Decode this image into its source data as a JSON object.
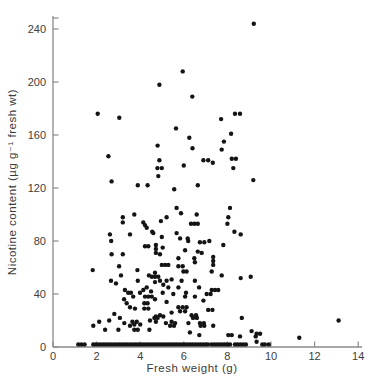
{
  "figure": {
    "background": "#ffffff",
    "axis_color": "#8a8a8a",
    "dot_color": "#141414",
    "text_color": "#3d3d3d"
  },
  "chart_data": {
    "type": "scatter",
    "title": "",
    "xlabel": "Fresh weight (g)",
    "ylabel": "Nicotine content (µg g⁻¹ fresh wt)",
    "xlim": [
      0,
      14.3
    ],
    "ylim": [
      0,
      252
    ],
    "x_ticks": [
      0,
      2,
      4,
      6,
      8,
      10,
      12,
      14
    ],
    "y_ticks": [
      0,
      40,
      80,
      120,
      160,
      200,
      240
    ],
    "grid": false,
    "legend": "none",
    "marker": {
      "shape": "circle",
      "color": "#141414",
      "radius_px": 2.2
    },
    "points": [
      [
        9.21,
        244
      ],
      [
        5.95,
        208
      ],
      [
        4.88,
        198
      ],
      [
        6.39,
        189
      ],
      [
        2.05,
        176
      ],
      [
        8.35,
        176
      ],
      [
        8.58,
        176
      ],
      [
        3.04,
        173
      ],
      [
        7.71,
        172
      ],
      [
        5.64,
        165
      ],
      [
        8.17,
        161
      ],
      [
        6.25,
        158
      ],
      [
        7.84,
        155
      ],
      [
        4.8,
        152
      ],
      [
        6.4,
        150
      ],
      [
        7.74,
        149
      ],
      [
        2.54,
        144
      ],
      [
        8.2,
        142
      ],
      [
        8.39,
        142
      ],
      [
        4.88,
        141
      ],
      [
        6.9,
        141
      ],
      [
        7.12,
        141
      ],
      [
        7.33,
        139
      ],
      [
        6.0,
        137
      ],
      [
        4.79,
        135
      ],
      [
        4.99,
        135
      ],
      [
        8.27,
        135
      ],
      [
        4.83,
        129
      ],
      [
        9.19,
        126
      ],
      [
        2.69,
        125
      ],
      [
        3.89,
        122
      ],
      [
        4.34,
        122
      ],
      [
        6.64,
        122
      ],
      [
        5.56,
        119
      ],
      [
        5.67,
        105
      ],
      [
        8.12,
        105
      ],
      [
        5.87,
        101
      ],
      [
        6.59,
        100
      ],
      [
        3.73,
        100
      ],
      [
        3.2,
        98
      ],
      [
        5.21,
        98
      ],
      [
        8.04,
        98
      ],
      [
        4.95,
        95
      ],
      [
        3.2,
        94
      ],
      [
        4.14,
        94
      ],
      [
        6.33,
        93
      ],
      [
        6.48,
        93
      ],
      [
        6.64,
        93
      ],
      [
        8.0,
        93
      ],
      [
        4.22,
        92
      ],
      [
        4.3,
        90
      ],
      [
        4.55,
        87
      ],
      [
        8.32,
        87
      ],
      [
        5.67,
        86
      ],
      [
        4.6,
        86
      ],
      [
        2.61,
        85
      ],
      [
        3.53,
        85
      ],
      [
        4.99,
        83
      ],
      [
        5.83,
        82
      ],
      [
        8.61,
        85
      ],
      [
        6.18,
        82
      ],
      [
        2.67,
        80
      ],
      [
        6.2,
        80
      ],
      [
        6.74,
        79
      ],
      [
        6.94,
        79
      ],
      [
        7.17,
        80
      ],
      [
        7.81,
        77
      ],
      [
        4.72,
        77
      ],
      [
        4.22,
        76
      ],
      [
        4.37,
        76
      ],
      [
        5.03,
        75
      ],
      [
        4.72,
        74
      ],
      [
        6.06,
        73
      ],
      [
        6.64,
        72
      ],
      [
        6.82,
        71
      ],
      [
        4.72,
        71
      ],
      [
        4.91,
        70
      ],
      [
        2.69,
        70
      ],
      [
        3.2,
        70
      ],
      [
        5.75,
        67
      ],
      [
        6.48,
        67
      ],
      [
        7.35,
        68
      ],
      [
        7.35,
        65
      ],
      [
        6.51,
        64
      ],
      [
        4.99,
        62
      ],
      [
        5.14,
        62
      ],
      [
        5.29,
        62
      ],
      [
        7.35,
        62
      ],
      [
        5.75,
        61
      ],
      [
        5.95,
        61
      ],
      [
        3.03,
        61
      ],
      [
        1.82,
        58
      ],
      [
        3.87,
        58
      ],
      [
        5.98,
        57
      ],
      [
        6.13,
        57
      ],
      [
        7.28,
        57
      ],
      [
        4.68,
        56
      ],
      [
        4.4,
        54
      ],
      [
        7.74,
        54
      ],
      [
        3.12,
        54
      ],
      [
        4.53,
        53
      ],
      [
        4.68,
        53
      ],
      [
        4.83,
        53
      ],
      [
        9.07,
        53
      ],
      [
        8.61,
        52
      ],
      [
        5.44,
        51
      ],
      [
        2.66,
        50
      ],
      [
        5.21,
        50
      ],
      [
        5.9,
        50
      ],
      [
        6.51,
        50
      ],
      [
        4.91,
        50
      ],
      [
        3.89,
        50
      ],
      [
        4.68,
        49
      ],
      [
        2.89,
        48
      ],
      [
        5.06,
        47
      ],
      [
        4.3,
        45
      ],
      [
        5.29,
        45
      ],
      [
        5.75,
        45
      ],
      [
        6.7,
        45
      ],
      [
        7.28,
        43
      ],
      [
        7.43,
        43
      ],
      [
        7.58,
        43
      ],
      [
        3.3,
        43
      ],
      [
        4.14,
        43
      ],
      [
        4.5,
        42
      ],
      [
        3.45,
        41
      ],
      [
        3.99,
        41
      ],
      [
        3.58,
        41
      ],
      [
        5.03,
        41
      ],
      [
        5.52,
        40
      ],
      [
        6.1,
        41
      ],
      [
        7.05,
        40
      ],
      [
        7.23,
        40
      ],
      [
        3.68,
        38
      ],
      [
        4.22,
        38
      ],
      [
        4.37,
        38
      ],
      [
        4.53,
        38
      ],
      [
        6.06,
        38
      ],
      [
        6.51,
        38
      ],
      [
        3.26,
        36
      ],
      [
        4.68,
        36
      ],
      [
        6.9,
        35
      ],
      [
        5.21,
        34
      ],
      [
        3.38,
        33
      ],
      [
        4.19,
        33
      ],
      [
        4.34,
        33
      ],
      [
        3.53,
        30
      ],
      [
        5.75,
        30
      ],
      [
        5.95,
        30
      ],
      [
        6.13,
        30
      ],
      [
        3.76,
        29
      ],
      [
        4.19,
        29
      ],
      [
        4.37,
        29
      ],
      [
        7.12,
        28
      ],
      [
        7.31,
        28
      ],
      [
        5.83,
        27
      ],
      [
        6.06,
        27
      ],
      [
        5.44,
        26
      ],
      [
        2.81,
        25
      ],
      [
        4.91,
        24
      ],
      [
        6.36,
        24
      ],
      [
        6.56,
        24
      ],
      [
        4.72,
        23
      ],
      [
        6.42,
        22
      ],
      [
        6.6,
        22
      ],
      [
        5.06,
        23
      ],
      [
        3.07,
        22
      ],
      [
        8.66,
        22
      ],
      [
        2.58,
        20
      ],
      [
        4.45,
        20
      ],
      [
        4.65,
        22
      ],
      [
        4.8,
        22
      ],
      [
        13.1,
        20
      ],
      [
        5.44,
        19
      ],
      [
        2.12,
        19
      ],
      [
        3.64,
        19
      ],
      [
        3.84,
        19
      ],
      [
        4.72,
        19
      ],
      [
        5.6,
        18
      ],
      [
        6.21,
        18
      ],
      [
        5.18,
        18
      ],
      [
        6.74,
        18
      ],
      [
        6.92,
        18
      ],
      [
        3.27,
        18
      ],
      [
        3.73,
        17
      ],
      [
        4.0,
        17
      ],
      [
        5.37,
        16
      ],
      [
        1.85,
        16
      ],
      [
        3.53,
        16
      ],
      [
        5.55,
        16
      ],
      [
        6.77,
        16
      ],
      [
        6.94,
        16
      ],
      [
        7.35,
        16
      ],
      [
        2.39,
        13
      ],
      [
        3.0,
        13
      ],
      [
        3.73,
        13
      ],
      [
        3.89,
        13
      ],
      [
        4.42,
        13
      ],
      [
        6.28,
        11
      ],
      [
        9.11,
        12
      ],
      [
        6.71,
        9
      ],
      [
        8.04,
        9
      ],
      [
        8.2,
        9
      ],
      [
        9.34,
        10
      ],
      [
        9.5,
        10
      ],
      [
        8.58,
        8
      ],
      [
        9.3,
        8
      ],
      [
        11.3,
        7
      ],
      [
        9.34,
        4
      ],
      [
        1.16,
        2
      ],
      [
        1.3,
        2
      ],
      [
        1.45,
        2
      ],
      [
        1.85,
        2
      ],
      [
        1.97,
        2
      ],
      [
        2.09,
        2
      ],
      [
        2.21,
        2
      ],
      [
        2.33,
        2
      ],
      [
        2.45,
        2
      ],
      [
        2.57,
        2
      ],
      [
        2.69,
        2
      ],
      [
        2.81,
        2
      ],
      [
        2.93,
        2
      ],
      [
        3.05,
        2
      ],
      [
        3.17,
        2
      ],
      [
        3.29,
        2
      ],
      [
        3.41,
        2
      ],
      [
        3.53,
        2
      ],
      [
        3.65,
        2
      ],
      [
        3.77,
        2
      ],
      [
        3.89,
        2
      ],
      [
        4.01,
        2
      ],
      [
        4.13,
        2
      ],
      [
        4.25,
        2
      ],
      [
        4.37,
        2
      ],
      [
        4.49,
        2
      ],
      [
        4.61,
        2
      ],
      [
        4.73,
        2
      ],
      [
        4.85,
        2
      ],
      [
        4.97,
        2
      ],
      [
        5.09,
        2
      ],
      [
        5.21,
        2
      ],
      [
        5.33,
        2
      ],
      [
        5.45,
        2
      ],
      [
        5.57,
        2
      ],
      [
        5.69,
        2
      ],
      [
        5.81,
        2
      ],
      [
        5.93,
        2
      ],
      [
        6.05,
        2
      ],
      [
        6.17,
        2
      ],
      [
        6.29,
        2
      ],
      [
        6.41,
        2
      ],
      [
        6.53,
        2
      ],
      [
        6.65,
        2
      ],
      [
        6.77,
        2
      ],
      [
        6.89,
        2
      ],
      [
        7.01,
        2
      ],
      [
        7.11,
        2
      ],
      [
        7.28,
        2
      ],
      [
        7.4,
        2
      ],
      [
        7.52,
        2
      ],
      [
        7.64,
        2
      ],
      [
        7.76,
        2
      ],
      [
        7.88,
        2
      ],
      [
        8.0,
        2
      ],
      [
        8.12,
        2
      ],
      [
        8.35,
        2
      ],
      [
        8.47,
        2
      ],
      [
        8.59,
        2
      ],
      [
        8.72,
        2
      ],
      [
        8.85,
        2
      ],
      [
        9.6,
        2
      ],
      [
        9.72,
        2
      ],
      [
        9.9,
        2
      ]
    ]
  }
}
